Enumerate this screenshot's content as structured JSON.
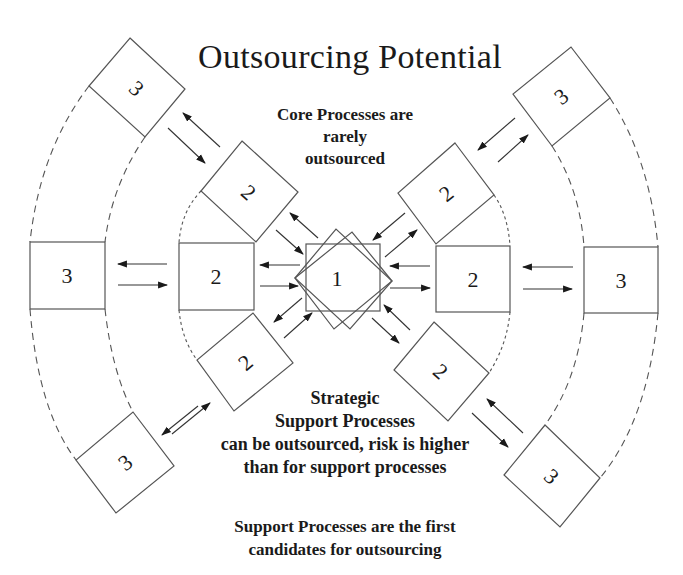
{
  "title": "Outsourcing Potential",
  "annotations": {
    "core": [
      "Core Processes are",
      "rarely",
      "outsourced"
    ],
    "strategic": [
      "Strategic",
      "Support Processes",
      "can be outsourced, risk is higher",
      "than for support processes"
    ],
    "support": [
      "Support Processes are the first",
      "candidates for outsourcing"
    ]
  },
  "nodes": {
    "core": {
      "label": "1",
      "level": "core"
    },
    "strategic": [
      {
        "label": "2",
        "position": "upper-left"
      },
      {
        "label": "2",
        "position": "left"
      },
      {
        "label": "2",
        "position": "lower-left"
      },
      {
        "label": "2",
        "position": "upper-right"
      },
      {
        "label": "2",
        "position": "right"
      },
      {
        "label": "2",
        "position": "lower-right"
      }
    ],
    "support": [
      {
        "label": "3",
        "position": "upper-left"
      },
      {
        "label": "3",
        "position": "left"
      },
      {
        "label": "3",
        "position": "lower-left"
      },
      {
        "label": "3",
        "position": "upper-right"
      },
      {
        "label": "3",
        "position": "right"
      },
      {
        "label": "3",
        "position": "lower-right"
      }
    ]
  },
  "colors": {
    "stroke": "#555555",
    "text": "#1a1a1a",
    "background": "#ffffff"
  }
}
